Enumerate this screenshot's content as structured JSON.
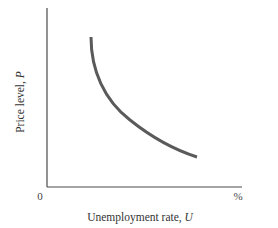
{
  "chart_data": {
    "type": "line",
    "title": "",
    "xlabel": "Unemployment rate, U",
    "ylabel": "Price level, P",
    "x_origin_label": "0",
    "x_end_label": "%",
    "grid": false,
    "legend": null,
    "series": [
      {
        "name": "curve",
        "description": "Downward-sloping convex curve: price level falls as unemployment rate rises",
        "color": "#5a5a5a",
        "points_px": [
          [
            91,
            37
          ],
          [
            93,
            58
          ],
          [
            99,
            78
          ],
          [
            110,
            98
          ],
          [
            125,
            116
          ],
          [
            145,
            132
          ],
          [
            170,
            146
          ],
          [
            197,
            157
          ]
        ]
      }
    ],
    "axes": {
      "origin_px": [
        47,
        187
      ],
      "x_axis_end_px": 242,
      "y_axis_top_px": 8,
      "color": "#4a4a4a"
    }
  }
}
